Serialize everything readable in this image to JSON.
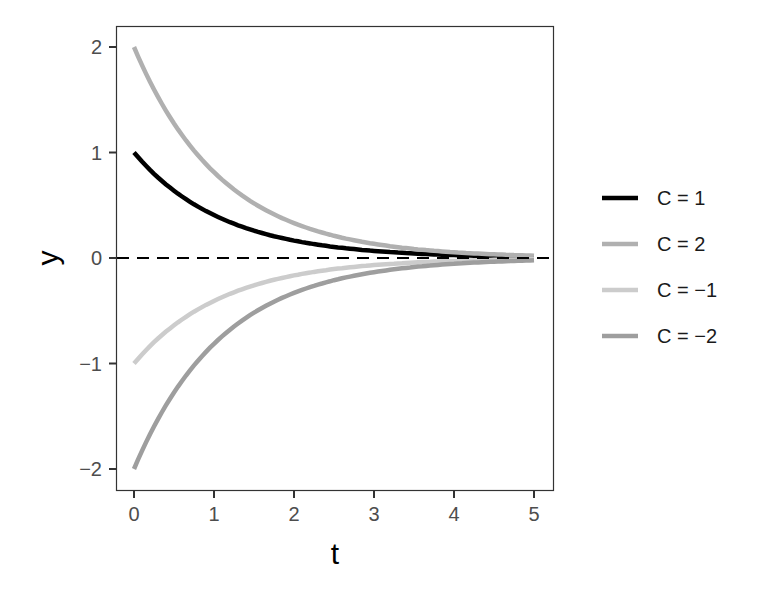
{
  "chart_data": {
    "type": "line",
    "title": "",
    "xlabel": "t",
    "ylabel": "y",
    "xlim": [
      -0.23,
      5.25
    ],
    "ylim": [
      -2.2,
      2.2
    ],
    "xticks": [
      0,
      1,
      2,
      3,
      4,
      5
    ],
    "yticks": [
      -2,
      -1,
      0,
      1,
      2
    ],
    "xtick_labels": [
      "0",
      "1",
      "2",
      "3",
      "4",
      "5"
    ],
    "ytick_labels": [
      "−2",
      "−1",
      "0",
      "1",
      "2"
    ],
    "grid": false,
    "legend_position": "right",
    "x": [
      0,
      0.5,
      1,
      1.5,
      2,
      2.5,
      3,
      3.5,
      4,
      4.5,
      5
    ],
    "series": [
      {
        "name": "C = 1",
        "color": "#000000",
        "values": [
          1,
          0.64,
          0.41,
          0.26,
          0.17,
          0.11,
          0.07,
          0.04,
          0.03,
          0.02,
          0.01
        ]
      },
      {
        "name": "C = 2",
        "color": "#b0b0b0",
        "values": [
          2,
          1.28,
          0.81,
          0.52,
          0.33,
          0.21,
          0.13,
          0.09,
          0.05,
          0.03,
          0.02
        ]
      },
      {
        "name": "C = −1",
        "color": "#cccccc",
        "values": [
          -1,
          -0.64,
          -0.41,
          -0.26,
          -0.17,
          -0.11,
          -0.07,
          -0.04,
          -0.03,
          -0.02,
          -0.01
        ]
      },
      {
        "name": "C = −2",
        "color": "#9e9e9e",
        "values": [
          -2,
          -1.28,
          -0.81,
          -0.52,
          -0.33,
          -0.21,
          -0.13,
          -0.09,
          -0.05,
          -0.03,
          -0.02
        ]
      }
    ],
    "annotations": [
      {
        "type": "hline",
        "y": 0,
        "style": "dashed",
        "color": "#000000"
      }
    ]
  },
  "legend": {
    "items": [
      {
        "label": "C = 1"
      },
      {
        "label": "C = 2"
      },
      {
        "label": "C = −1"
      },
      {
        "label": "C = −2"
      }
    ]
  }
}
